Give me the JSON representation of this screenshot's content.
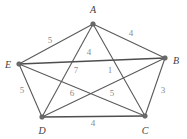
{
  "figure": {
    "type": "weighted-graph",
    "background_color": "#ffffff",
    "edge_color": "#5a5a5a",
    "vertex_color": "#6b6b6b",
    "label_color": "#3f3f3f",
    "weight_color": "#8a8a8a"
  },
  "vertices": [
    {
      "id": "A",
      "label": "A",
      "x": 93,
      "y": 24,
      "label_x": 93,
      "label_y": 9
    },
    {
      "id": "B",
      "label": "B",
      "x": 165,
      "y": 58,
      "label_x": 176,
      "label_y": 60
    },
    {
      "id": "C",
      "label": "C",
      "x": 145,
      "y": 116,
      "label_x": 145,
      "label_y": 130
    },
    {
      "id": "D",
      "label": "D",
      "x": 42,
      "y": 117,
      "label_x": 42,
      "label_y": 130
    },
    {
      "id": "E",
      "label": "E",
      "x": 19,
      "y": 64,
      "label_x": 8,
      "label_y": 64
    }
  ],
  "edges": [
    {
      "from": "E",
      "to": "A",
      "weight": "5",
      "wx": 50,
      "wy": 40,
      "thick": false
    },
    {
      "from": "A",
      "to": "B",
      "weight": "4",
      "wx": 131,
      "wy": 33,
      "thick": false
    },
    {
      "from": "B",
      "to": "C",
      "weight": "3",
      "wx": 163,
      "wy": 90,
      "thick": false
    },
    {
      "from": "C",
      "to": "D",
      "weight": "4",
      "wx": 93,
      "wy": 123,
      "thick": true
    },
    {
      "from": "D",
      "to": "E",
      "weight": "5",
      "wx": 22,
      "wy": 90,
      "thick": false
    },
    {
      "from": "A",
      "to": "D",
      "weight": "4",
      "wx": 89,
      "wy": 52,
      "thick": false
    },
    {
      "from": "A",
      "to": "C",
      "weight": "1",
      "wx": 110,
      "wy": 70,
      "thick": false
    },
    {
      "from": "E",
      "to": "B",
      "weight": "7",
      "wx": 76,
      "wy": 70,
      "thick": true
    },
    {
      "from": "E",
      "to": "C",
      "weight": "6",
      "wx": 72,
      "wy": 93,
      "thick": false
    },
    {
      "from": "D",
      "to": "B",
      "weight": "5",
      "wx": 112,
      "wy": 93,
      "thick": false
    }
  ]
}
